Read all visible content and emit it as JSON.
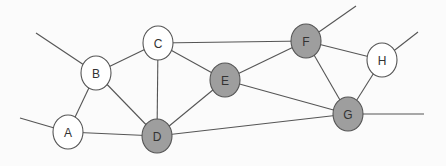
{
  "diagram": {
    "type": "graph",
    "colors": {
      "background": "#fbfbfb",
      "edge": "#555555",
      "node_white": "#ffffff",
      "node_gray": "#9e9e9e"
    },
    "nodes": [
      {
        "id": "A",
        "label": "A",
        "x": 68,
        "y": 132,
        "fill": "white"
      },
      {
        "id": "B",
        "label": "B",
        "x": 96,
        "y": 73,
        "fill": "white"
      },
      {
        "id": "C",
        "label": "C",
        "x": 158,
        "y": 43,
        "fill": "white"
      },
      {
        "id": "D",
        "label": "D",
        "x": 157,
        "y": 136,
        "fill": "gray"
      },
      {
        "id": "E",
        "label": "E",
        "x": 225,
        "y": 80,
        "fill": "gray"
      },
      {
        "id": "F",
        "label": "F",
        "x": 306,
        "y": 41,
        "fill": "gray"
      },
      {
        "id": "H",
        "label": "H",
        "x": 382,
        "y": 60,
        "fill": "white"
      },
      {
        "id": "G",
        "label": "G",
        "x": 348,
        "y": 114,
        "fill": "gray"
      }
    ],
    "edges": [
      {
        "from": "A",
        "to": "B"
      },
      {
        "from": "A",
        "to": "D"
      },
      {
        "from": "B",
        "to": "C"
      },
      {
        "from": "B",
        "to": "D"
      },
      {
        "from": "C",
        "to": "D"
      },
      {
        "from": "C",
        "to": "E"
      },
      {
        "from": "C",
        "to": "F"
      },
      {
        "from": "D",
        "to": "E"
      },
      {
        "from": "D",
        "to": "G"
      },
      {
        "from": "E",
        "to": "F"
      },
      {
        "from": "E",
        "to": "G"
      },
      {
        "from": "F",
        "to": "G"
      },
      {
        "from": "F",
        "to": "H"
      },
      {
        "from": "H",
        "to": "G"
      }
    ],
    "dangling_edges": [
      {
        "from": "B",
        "to_point": [
          36,
          33
        ]
      },
      {
        "from": "A",
        "to_point": [
          20,
          118
        ]
      },
      {
        "from": "F",
        "to_point": [
          356,
          6
        ]
      },
      {
        "from": "H",
        "to_point": [
          418,
          32
        ]
      },
      {
        "from": "G",
        "to_point": [
          424,
          114
        ]
      }
    ]
  }
}
